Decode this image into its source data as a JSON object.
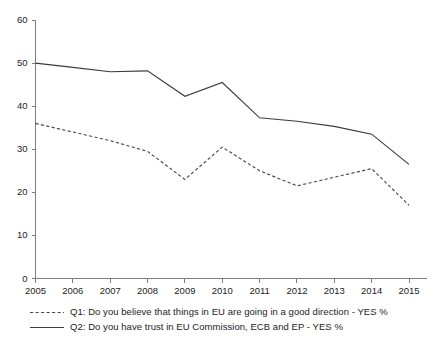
{
  "chart_data": {
    "type": "line",
    "title": "",
    "xlabel": "",
    "ylabel": "",
    "x": [
      2005,
      2006,
      2007,
      2008,
      2009,
      2010,
      2011,
      2012,
      2013,
      2014,
      2015
    ],
    "categories": [
      "2005",
      "2006",
      "2007",
      "2008",
      "2009",
      "2010",
      "2011",
      "2012",
      "2013",
      "2014",
      "2015"
    ],
    "ylim": [
      0,
      60
    ],
    "xlim": [
      2005,
      2015
    ],
    "yticks": [
      "0",
      "10",
      "20",
      "30",
      "40",
      "50",
      "60"
    ],
    "ytick_values": [
      0,
      10,
      20,
      30,
      40,
      50,
      60
    ],
    "grid": false,
    "legend_position": "bottom-left",
    "series": [
      {
        "name": "Q1: Do you believe that things in EU are going in a good direction - YES %",
        "style": "dashed",
        "color": "#4a4a4f",
        "values": [
          36.0,
          34.0,
          32.0,
          29.5,
          23.0,
          30.5,
          25.0,
          21.5,
          23.5,
          25.5,
          17.0
        ]
      },
      {
        "name": "Q2: Do you have trust in EU Commission, ECB and EP - YES %",
        "style": "solid",
        "color": "#3b3b3f",
        "values": [
          50.0,
          49.0,
          48.0,
          48.2,
          42.3,
          45.5,
          37.3,
          36.5,
          35.3,
          33.5,
          26.5
        ]
      }
    ],
    "legend": [
      {
        "label": "Q1: Do you believe that things in EU are going in a good direction - YES %",
        "style": "dashed"
      },
      {
        "label": "Q2: Do you have trust in EU Commission, ECB and EP - YES %",
        "style": "solid"
      }
    ]
  }
}
